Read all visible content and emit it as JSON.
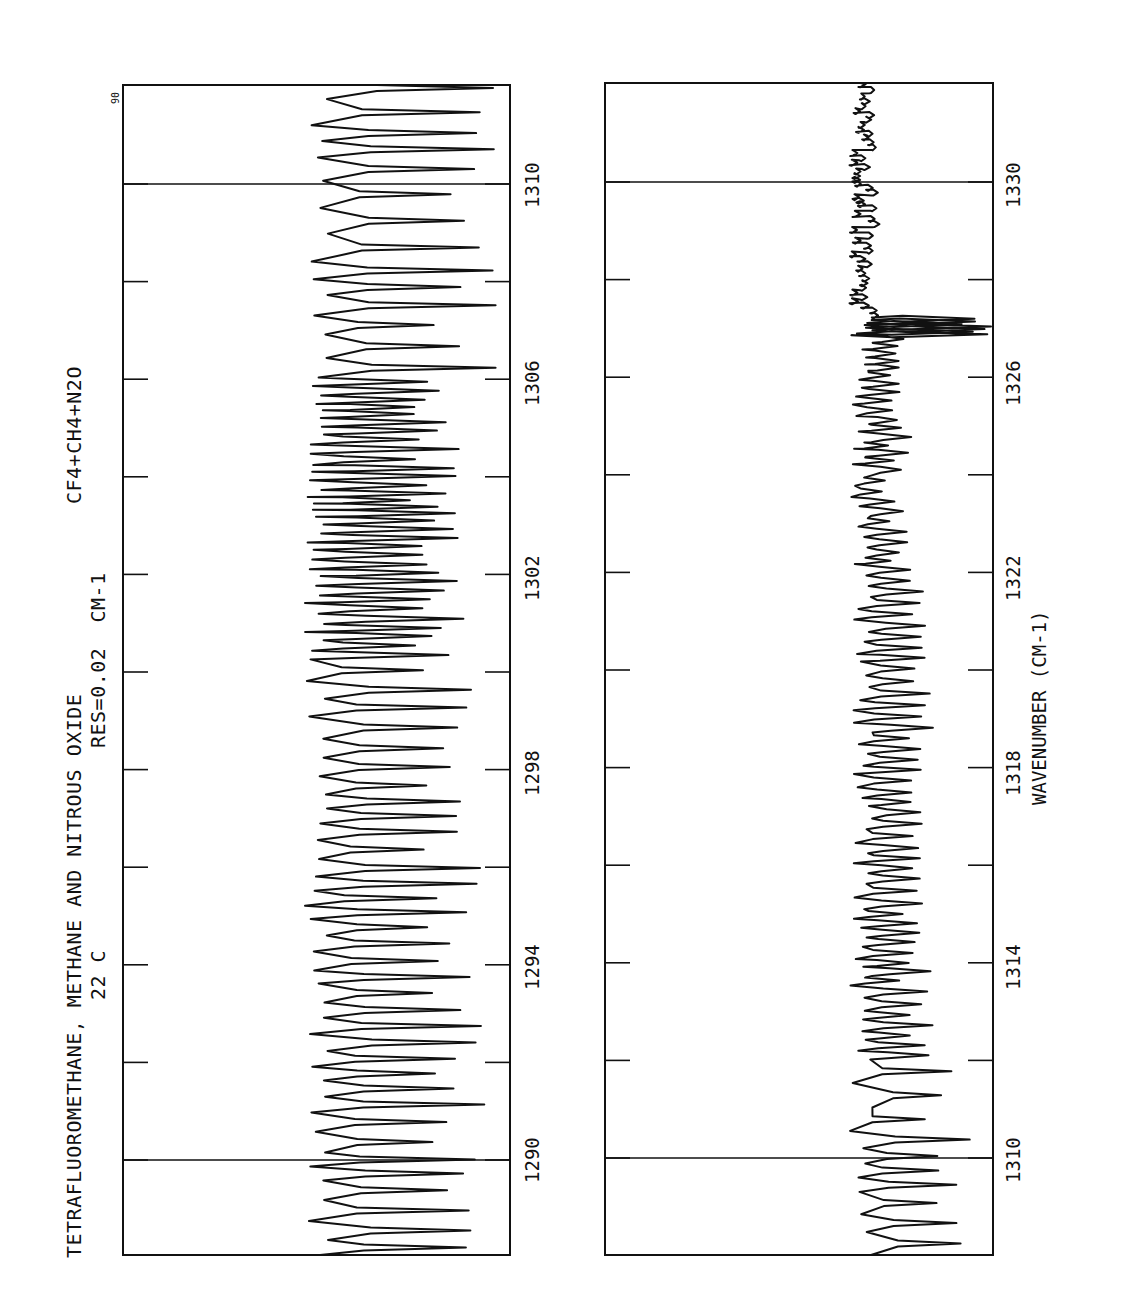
{
  "figure": {
    "title": "TETRAFLUOROMETHANE, METHANE AND NITROUS OXIDE",
    "temperature": "22 C",
    "resolution": "RES=0.02  CM-1",
    "sample": "CF4+CH4+N2O",
    "corner_mark": "90",
    "x_axis_label": "WAVENUMBER (CM-1)"
  },
  "panels": [
    {
      "id": "left",
      "range": [
        1288.2,
        1312.2
      ],
      "tick_labels": [
        "1290",
        "1294",
        "1298",
        "1302",
        "1306",
        "1310"
      ],
      "marker_lines": [
        "1290",
        "1310"
      ]
    },
    {
      "id": "right",
      "range": [
        1308.2,
        1332.2
      ],
      "tick_labels": [
        "1310",
        "1314",
        "1318",
        "1322",
        "1326",
        "1330"
      ],
      "marker_lines": [
        "1310",
        "1330"
      ]
    }
  ],
  "chart_data": [
    {
      "type": "line",
      "title": "TETRAFLUOROMETHANE, METHANE AND NITROUS OXIDE — 22 C, RES=0.02 CM-1 — CF4+CH4+N2O (panel 1)",
      "xlabel": "WAVENUMBER (CM-1)",
      "ylabel": "Transmittance",
      "orientation": "rotated 90° (wavenumber increases toward top of page)",
      "xlim": [
        1288.2,
        1312.2
      ],
      "x_ticks": [
        1290,
        1292,
        1294,
        1296,
        1298,
        1300,
        1302,
        1304,
        1306,
        1308,
        1310
      ],
      "x_tick_labels": [
        "1290",
        "1294",
        "1298",
        "1302",
        "1306",
        "1310"
      ],
      "grid": false,
      "description": "Dense rotational-vibrational absorption spectrum; regular ~0.4 cm-1 spaced strong absorption lines (baseline ~50% of frame) across 1288–1312, with dense clustered lines between 1300 and 1306.",
      "features": [
        {
          "region": "1288-1300",
          "pattern": "regularly spaced strong lines, nearly saturating"
        },
        {
          "region": "1300-1306",
          "pattern": "densely packed overlapping lines"
        },
        {
          "region": "1306-1312",
          "pattern": "well-separated strong doublets"
        }
      ]
    },
    {
      "type": "line",
      "title": "TETRAFLUOROMETHANE, METHANE AND NITROUS OXIDE — 22 C, RES=0.02 CM-1 — CF4+CH4+N2O (panel 2)",
      "xlabel": "WAVENUMBER (CM-1)",
      "ylabel": "Transmittance",
      "orientation": "rotated 90° (wavenumber increases toward top of page)",
      "xlim": [
        1308.2,
        1332.2
      ],
      "x_ticks": [
        1310,
        1312,
        1314,
        1316,
        1318,
        1320,
        1322,
        1324,
        1326,
        1328,
        1330
      ],
      "x_tick_labels": [
        "1310",
        "1314",
        "1318",
        "1322",
        "1326",
        "1330"
      ],
      "grid": false,
      "description": "Continuation spectrum; strong lines 1308–1314 fading to weak lines 1314–1326, a strong multiplet near 1327, then nearly flat baseline with weak noise 1327–1332.",
      "features": [
        {
          "region": "1308-1312",
          "pattern": "strong regular lines"
        },
        {
          "region": "1312-1322",
          "pattern": "moderate to weak line forest"
        },
        {
          "region": "1322-1326.8",
          "pattern": "weak lines"
        },
        {
          "region": "1327",
          "pattern": "strong narrow multiplet"
        },
        {
          "region": "1327.2-1332",
          "pattern": "near-continuum baseline"
        }
      ]
    }
  ]
}
